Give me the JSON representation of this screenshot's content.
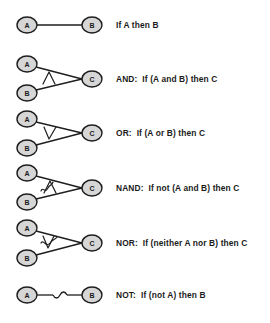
{
  "diagram": {
    "type": "logic-connective-diagrams",
    "node_fill": "#d6d6d6",
    "stroke_color": "#1e1e1e",
    "rows": [
      {
        "id": "implication",
        "nodes": {
          "a": "A",
          "b": "B"
        },
        "gate_symbol": "none",
        "label": "If A then B"
      },
      {
        "id": "and",
        "nodes": {
          "a": "A",
          "b": "B",
          "c": "C"
        },
        "gate_symbol": "and-wedge",
        "label": "AND:  If (A and B) then C"
      },
      {
        "id": "or",
        "nodes": {
          "a": "A",
          "b": "B",
          "c": "C"
        },
        "gate_symbol": "or-vee",
        "label": "OR:  If (A or B) then C"
      },
      {
        "id": "nand",
        "nodes": {
          "a": "A",
          "b": "B",
          "c": "C"
        },
        "gate_symbol": "negated-and-wedge",
        "label": "NAND:  If not (A and B) then C"
      },
      {
        "id": "nor",
        "nodes": {
          "a": "A",
          "b": "B",
          "c": "C"
        },
        "gate_symbol": "negated-or-vee",
        "label": "NOR:  If (neither A nor B) then C"
      },
      {
        "id": "not",
        "nodes": {
          "a": "A",
          "b": "B"
        },
        "gate_symbol": "tilde",
        "label": "NOT:  If (not A) then B"
      }
    ]
  }
}
